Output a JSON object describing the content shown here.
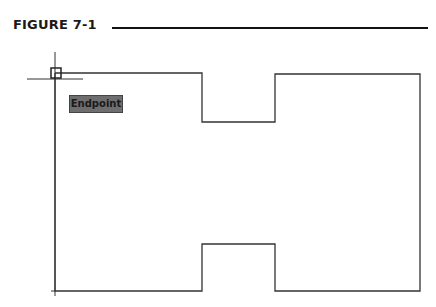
{
  "figure": {
    "label": "FIGURE 7-1"
  },
  "drawing": {
    "shape_points": "55,73 202,73 202,122 275,122 275,74 420,74 420,291 275,291 275,244 202,244 202,291 55,291 55,73",
    "line_color": "#333333",
    "crosshair": {
      "x": 55,
      "y": 79,
      "h_from": 27,
      "h_to": 83,
      "v_from": 52,
      "v_to": 296
    },
    "aperture": {
      "x": 51,
      "y": 68,
      "size": 10
    }
  },
  "osnap_tooltip": {
    "label": "Endpoint",
    "fill": "#6e6e6e"
  }
}
